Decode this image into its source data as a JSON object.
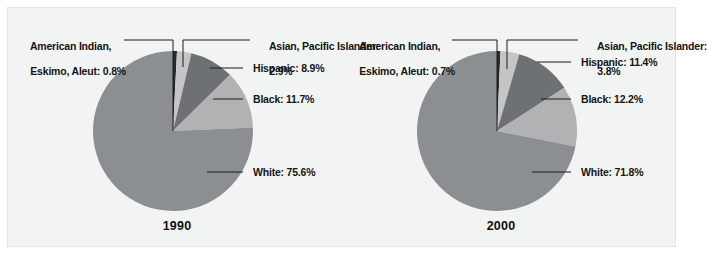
{
  "figure": {
    "background_color": "#f2f3f3",
    "border_color": "#e2e3e4"
  },
  "chart_data": {
    "type": "pie",
    "title": "",
    "legend_position": "callout-labels",
    "shared_categories": [
      "American Indian, Eskimo, Aleut",
      "Asian, Pacific Islander",
      "Hispanic",
      "Black",
      "White"
    ],
    "slice_colors": [
      "#2a2a2a",
      "#c4c5c6",
      "#6e7173",
      "#b0b2b3",
      "#8c8f91"
    ],
    "charts": [
      {
        "title": "1990",
        "categories": [
          "American Indian, Eskimo, Aleut",
          "Asian, Pacific Islander",
          "Hispanic",
          "Black",
          "White"
        ],
        "values": [
          0.8,
          2.9,
          8.9,
          11.7,
          75.6
        ],
        "unit": "%"
      },
      {
        "title": "2000",
        "categories": [
          "American Indian, Eskimo, Aleut",
          "Asian, Pacific Islander",
          "Hispanic",
          "Black",
          "White"
        ],
        "values": [
          0.7,
          3.8,
          11.4,
          12.2,
          71.8
        ],
        "unit": "%"
      }
    ]
  },
  "panels": [
    {
      "id": "1990",
      "year_label": "1990",
      "labels": {
        "american_indian_line1": "American Indian,",
        "american_indian_line2": "Eskimo, Aleut: 0.8%",
        "asian_line1": "Asian, Pacific Islander:",
        "asian_line2": "2.9%",
        "hispanic": "Hispanic: 8.9%",
        "black": "Black: 11.7%",
        "white": "White: 75.6%"
      }
    },
    {
      "id": "2000",
      "year_label": "2000",
      "labels": {
        "american_indian_line1": "American Indian,",
        "american_indian_line2": "Eskimo, Aleut: 0.7%",
        "asian_line1": "Asian, Pacific Islander:",
        "asian_line2": "3.8%",
        "hispanic": "Hispanic: 11.4%",
        "black": "Black: 12.2%",
        "white": "White: 71.8%"
      }
    }
  ]
}
